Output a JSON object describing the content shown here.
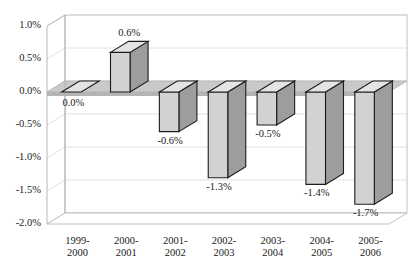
{
  "chart_data": {
    "type": "bar",
    "title": "",
    "subtitle": "",
    "xlabel": "",
    "ylabel": "",
    "categories": [
      "1999-\n2000",
      "2000-\n2001",
      "2001-\n2002",
      "2002-\n2003",
      "2003-\n2004",
      "2004-\n2005",
      "2005-\n2006"
    ],
    "category_lines": [
      [
        "1999-",
        "2000"
      ],
      [
        "2000-",
        "2001"
      ],
      [
        "2001-",
        "2002"
      ],
      [
        "2002-",
        "2003"
      ],
      [
        "2003-",
        "2004"
      ],
      [
        "2004-",
        "2005"
      ],
      [
        "2005-",
        "2006"
      ]
    ],
    "values": [
      0.0,
      0.6,
      -0.6,
      -1.3,
      -0.5,
      -1.4,
      -1.7
    ],
    "value_labels": [
      "0.0%",
      "0.6%",
      "-0.6%",
      "-1.3%",
      "-0.5%",
      "-1.4%",
      "-1.7%"
    ],
    "ylim": [
      -2.0,
      1.0
    ],
    "ytick_values": [
      1.0,
      0.5,
      0.0,
      -0.5,
      -1.0,
      -1.5,
      -2.0
    ],
    "ytick_labels": [
      "1.0%",
      "0.5%",
      "0.0%",
      "-0.5%",
      "-1.0%",
      "-1.5%",
      "-2.0%"
    ],
    "grid": true,
    "legend": "none",
    "style": "3d-column",
    "colors": {
      "bar_front": "#d2d2d2",
      "bar_top": "#e4e4e4",
      "bar_side": "#9d9d9d",
      "bar_outline": "#1c1c1c",
      "floor": "#c9c9c9",
      "floor_side": "#b4b4b4",
      "wall": "#ffffff",
      "grid": "#d8d8d8",
      "axis": "#b0b0b0",
      "text": "#1a1a1a"
    }
  },
  "footer": {
    "caption": ""
  }
}
